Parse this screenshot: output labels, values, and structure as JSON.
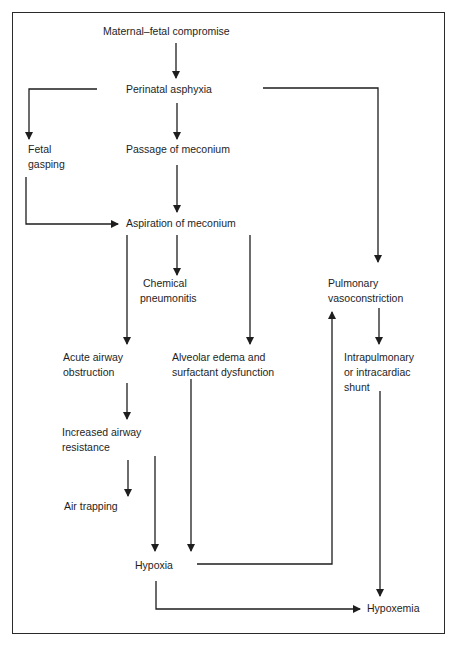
{
  "diagram": {
    "type": "flowchart",
    "title": "",
    "nodes": [
      {
        "id": "maternal",
        "lines": [
          "Maternal–fetal compromise"
        ]
      },
      {
        "id": "asphyxia",
        "lines": [
          "Perinatal asphyxia"
        ]
      },
      {
        "id": "gasping",
        "lines": [
          "Fetal",
          "gasping"
        ]
      },
      {
        "id": "passage",
        "lines": [
          "Passage of meconium"
        ]
      },
      {
        "id": "aspiration",
        "lines": [
          "Aspiration of meconium"
        ]
      },
      {
        "id": "pneumonitis",
        "lines": [
          "Chemical",
          "pneumonitis"
        ]
      },
      {
        "id": "vasoconstriction",
        "lines": [
          "Pulmonary",
          "vasoconstriction"
        ]
      },
      {
        "id": "obstruction",
        "lines": [
          "Acute airway",
          "obstruction"
        ]
      },
      {
        "id": "edema",
        "lines": [
          "Alveolar edema and",
          "surfactant dysfunction"
        ]
      },
      {
        "id": "shunt",
        "lines": [
          "Intrapulmonary",
          "or intracardiac",
          "shunt"
        ]
      },
      {
        "id": "resistance",
        "lines": [
          "Increased airway",
          "resistance"
        ]
      },
      {
        "id": "trapping",
        "lines": [
          "Air trapping"
        ]
      },
      {
        "id": "hypoxia",
        "lines": [
          "Hypoxia"
        ]
      },
      {
        "id": "hypoxemia",
        "lines": [
          "Hypoxemia"
        ]
      }
    ],
    "edges": [
      {
        "from": "maternal",
        "to": "asphyxia"
      },
      {
        "from": "asphyxia",
        "to": "gasping"
      },
      {
        "from": "asphyxia",
        "to": "passage"
      },
      {
        "from": "asphyxia",
        "to": "vasoconstriction"
      },
      {
        "from": "gasping",
        "to": "aspiration"
      },
      {
        "from": "passage",
        "to": "aspiration"
      },
      {
        "from": "aspiration",
        "to": "obstruction"
      },
      {
        "from": "aspiration",
        "to": "pneumonitis"
      },
      {
        "from": "aspiration",
        "to": "edema"
      },
      {
        "from": "vasoconstriction",
        "to": "shunt"
      },
      {
        "from": "obstruction",
        "to": "resistance"
      },
      {
        "from": "resistance",
        "to": "trapping"
      },
      {
        "from": "resistance",
        "to": "hypoxia"
      },
      {
        "from": "edema",
        "to": "hypoxia"
      },
      {
        "from": "hypoxia",
        "to": "vasoconstriction"
      },
      {
        "from": "hypoxia",
        "to": "hypoxemia"
      },
      {
        "from": "shunt",
        "to": "hypoxemia"
      }
    ],
    "colors": {
      "line": "#1e1e1e",
      "text": "#1e1e1e",
      "background": "#ffffff"
    }
  }
}
